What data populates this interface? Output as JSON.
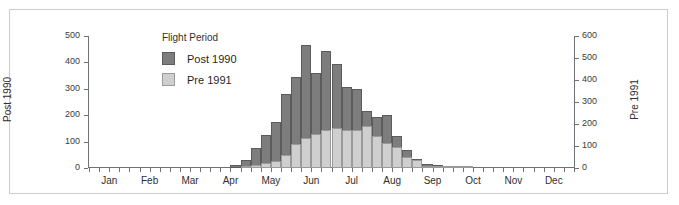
{
  "legend": {
    "title": "Flight Period",
    "entries": [
      {
        "label": "Post 1990",
        "color": "#7d7d7d"
      },
      {
        "label": "Pre 1991",
        "color": "#cfcfcf"
      }
    ]
  },
  "axes": {
    "left_title": "Post 1990",
    "right_title": "Pre 1991",
    "left_ticks": [
      "0",
      "100",
      "200",
      "300",
      "400",
      "500"
    ],
    "right_ticks": [
      "0",
      "100",
      "200",
      "300",
      "400",
      "500",
      "600"
    ],
    "months": [
      "Jan",
      "Feb",
      "Mar",
      "Apr",
      "May",
      "Jun",
      "Jul",
      "Aug",
      "Sep",
      "Oct",
      "Nov",
      "Dec"
    ]
  },
  "chart_data": {
    "type": "bar",
    "title": "",
    "subtitle": "",
    "xlabel": "",
    "ylabel": "Post 1990",
    "y2label": "Pre 1991",
    "ylim": [
      0,
      500
    ],
    "y2lim": [
      0,
      600
    ],
    "grid": false,
    "legend_position": "inside-top-left",
    "legend_title": "Flight Period",
    "bin": "weekly",
    "categories": [
      "Jan w1",
      "Jan w2",
      "Jan w3",
      "Jan w4",
      "Feb w1",
      "Feb w2",
      "Feb w3",
      "Feb w4",
      "Mar w1",
      "Mar w2",
      "Mar w3",
      "Mar w4",
      "Apr w1",
      "Apr w2",
      "Apr w3",
      "Apr w4",
      "May w1",
      "May w2",
      "May w3",
      "May w4",
      "Jun w1",
      "Jun w2",
      "Jun w3",
      "Jun w4",
      "Jul w1",
      "Jul w2",
      "Jul w3",
      "Jul w4",
      "Aug w1",
      "Aug w2",
      "Aug w3",
      "Aug w4",
      "Sep w1",
      "Sep w2",
      "Sep w3",
      "Sep w4",
      "Oct w1",
      "Oct w2",
      "Oct w3",
      "Oct w4",
      "Nov w1",
      "Nov w2",
      "Nov w3",
      "Nov w4",
      "Dec w1",
      "Dec w2",
      "Dec w3",
      "Dec w4"
    ],
    "series": [
      {
        "name": "Post 1990",
        "color": "#7d7d7d",
        "axis": "left",
        "values": [
          0,
          0,
          0,
          0,
          0,
          0,
          0,
          0,
          0,
          0,
          0,
          0,
          0,
          0,
          10,
          30,
          75,
          125,
          175,
          280,
          345,
          465,
          360,
          445,
          395,
          305,
          300,
          215,
          195,
          200,
          120,
          70,
          35,
          15,
          10,
          5,
          8,
          5,
          0,
          0,
          0,
          0,
          0,
          0,
          0,
          0,
          0,
          0
        ]
      },
      {
        "name": "Pre 1991",
        "color": "#cfcfcf",
        "axis": "right",
        "values": [
          0,
          0,
          0,
          0,
          0,
          0,
          0,
          0,
          0,
          0,
          0,
          0,
          0,
          0,
          0,
          5,
          12,
          25,
          30,
          60,
          110,
          135,
          155,
          175,
          180,
          175,
          175,
          190,
          145,
          115,
          95,
          50,
          35,
          10,
          10,
          5,
          5,
          5,
          0,
          0,
          0,
          0,
          0,
          0,
          0,
          0,
          0,
          0
        ]
      }
    ]
  }
}
